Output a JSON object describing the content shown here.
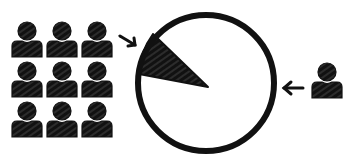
{
  "diagram": {
    "colors": {
      "ink": "#111111",
      "background": "#ffffff",
      "hatch": "#6a6a6a"
    },
    "group": {
      "icon": "person-icon",
      "rows": 3,
      "columns": 3,
      "count": 9
    },
    "pie": {
      "slice_fraction_estimate": 0.11,
      "slice_position": "upper-left"
    },
    "single_person": {
      "icon": "person-icon",
      "count": 1
    },
    "arrows": [
      {
        "from": "group",
        "to": "pie-slice",
        "direction": "down-right"
      },
      {
        "from": "single-person",
        "to": "pie",
        "direction": "left"
      }
    ]
  }
}
